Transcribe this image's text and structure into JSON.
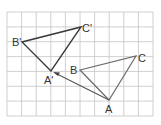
{
  "diagram": {
    "type": "translation-on-grid",
    "grid": {
      "cols": 10,
      "rows": 7,
      "color": "#bdbdbd"
    },
    "colors": {
      "original": "#666666",
      "image": "#333333",
      "arrow": "#555555"
    },
    "labels": {
      "A": "A",
      "B": "B",
      "C": "C",
      "A_prime": "A'",
      "B_prime": "B'",
      "C_prime": "C'"
    },
    "points": {
      "A": [
        109,
        100
      ],
      "B": [
        80,
        70
      ],
      "C": [
        136,
        56
      ],
      "A_prime": [
        51,
        71
      ],
      "B_prime": [
        22,
        42
      ],
      "C_prime": [
        81,
        27
      ]
    }
  }
}
